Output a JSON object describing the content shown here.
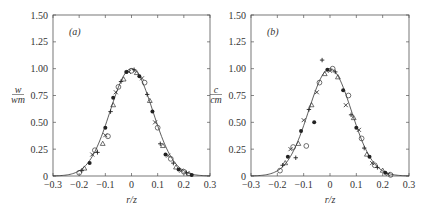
{
  "chart_data": [
    {
      "type": "scatter",
      "panel": "(a)",
      "title": "",
      "xlabel": "r/z",
      "ylabel": "w/w_m",
      "ylabel_num": "w",
      "ylabel_den": "w_m",
      "xlim": [
        -0.3,
        0.3
      ],
      "ylim": [
        0,
        1.5
      ],
      "xticks": [
        "-0.3",
        "-0.2",
        "-0.1",
        "0",
        "0.1",
        "0.2",
        "0.3"
      ],
      "yticks": [
        "0",
        "0.25",
        "0.50",
        "0.75",
        "1.00",
        "1.25",
        "1.50"
      ],
      "grid": false,
      "fit_curve": {
        "type": "gaussian",
        "peak": 1.0,
        "width_b": 0.115
      },
      "series": [
        {
          "name": "markers (mixed symbols: circles, crosses, triangles, filled)",
          "x": [
            -0.2,
            -0.19,
            -0.18,
            -0.16,
            -0.15,
            -0.14,
            -0.13,
            -0.11,
            -0.1,
            -0.1,
            -0.09,
            -0.08,
            -0.07,
            -0.07,
            -0.06,
            -0.05,
            -0.04,
            -0.03,
            -0.02,
            -0.01,
            0.0,
            0.01,
            0.02,
            0.03,
            0.04,
            0.05,
            0.06,
            0.07,
            0.08,
            0.09,
            0.1,
            0.11,
            0.12,
            0.13,
            0.14,
            0.15,
            0.16,
            0.17,
            0.18,
            0.19,
            0.2,
            0.21,
            0.22,
            0.23
          ],
          "y": [
            0.03,
            0.05,
            0.07,
            0.12,
            0.2,
            0.24,
            0.22,
            0.3,
            0.45,
            0.38,
            0.37,
            0.6,
            0.66,
            0.73,
            0.78,
            0.83,
            0.88,
            0.9,
            0.97,
            0.97,
            0.98,
            0.99,
            0.96,
            0.93,
            0.91,
            0.87,
            0.76,
            0.7,
            0.6,
            0.5,
            0.45,
            0.3,
            0.28,
            0.2,
            0.19,
            0.16,
            0.12,
            0.08,
            0.06,
            0.05,
            0.04,
            0.03,
            0.02,
            0.01
          ]
        }
      ]
    },
    {
      "type": "scatter",
      "panel": "(b)",
      "title": "",
      "xlabel": "r/z",
      "ylabel": "c/c_m",
      "ylabel_num": "c",
      "ylabel_den": "c_m",
      "xlim": [
        -0.3,
        0.3
      ],
      "ylim": [
        0,
        1.5
      ],
      "xticks": [
        "-0.3",
        "-0.2",
        "-0.1",
        "0",
        "0.1",
        "0.2",
        "0.3"
      ],
      "yticks": [
        "0",
        "0.25",
        "0.50",
        "0.75",
        "1.00",
        "1.25",
        "1.50"
      ],
      "grid": false,
      "fit_curve": {
        "type": "gaussian",
        "peak": 1.0,
        "width_b": 0.115
      },
      "series": [
        {
          "name": "markers (mixed symbols: circles, crosses, triangles, filled)",
          "x": [
            -0.19,
            -0.18,
            -0.17,
            -0.16,
            -0.15,
            -0.14,
            -0.13,
            -0.12,
            -0.11,
            -0.1,
            -0.09,
            -0.08,
            -0.07,
            -0.06,
            -0.05,
            -0.04,
            -0.03,
            -0.02,
            -0.01,
            0.0,
            0.01,
            0.02,
            0.03,
            0.05,
            0.06,
            0.07,
            0.08,
            0.09,
            0.1,
            0.11,
            0.12,
            0.13,
            0.14,
            0.15,
            0.16,
            0.17,
            0.18,
            0.2,
            0.21,
            0.22,
            0.23
          ],
          "y": [
            0.05,
            0.1,
            0.12,
            0.18,
            0.25,
            0.27,
            0.17,
            0.3,
            0.42,
            0.52,
            0.28,
            0.62,
            0.66,
            0.5,
            0.78,
            0.87,
            1.08,
            0.95,
            0.99,
            0.98,
            1.0,
            0.97,
            0.92,
            0.8,
            0.66,
            0.75,
            0.57,
            0.54,
            0.45,
            0.43,
            0.35,
            0.26,
            0.2,
            0.18,
            0.12,
            0.1,
            0.08,
            0.05,
            0.03,
            0.02,
            0.01
          ]
        }
      ]
    }
  ]
}
